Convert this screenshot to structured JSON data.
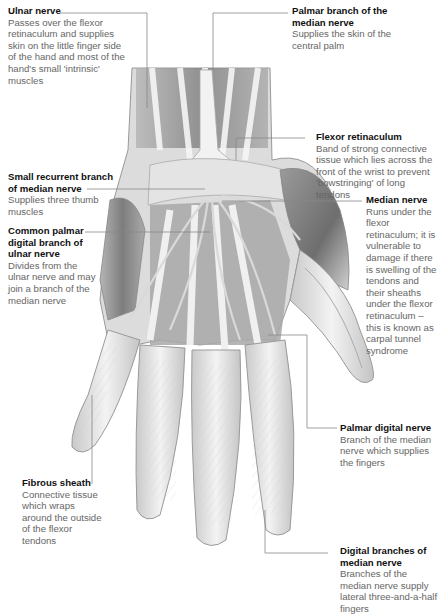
{
  "diagram": {
    "labels": [
      {
        "id": "ulnar-nerve",
        "title": "Ulnar nerve",
        "desc": "Passes over the flexor retinaculum and supplies skin on the little finger side of the hand and most of the hand's small 'intrinsic' muscles"
      },
      {
        "id": "palmar-branch-median",
        "title": "Palmar branch of the median nerve",
        "desc": "Supplies the skin of the central palm"
      },
      {
        "id": "flexor-retinaculum",
        "title": "Flexor retinaculum",
        "desc": "Band of strong connective tissue which lies across the front of the wrist to prevent 'bowstringing' of long tendons"
      },
      {
        "id": "small-recurrent-branch",
        "title": "Small recurrent branch of median nerve",
        "desc": "Supplies three thumb muscles"
      },
      {
        "id": "median-nerve",
        "title": "Median nerve",
        "desc": "Runs under the flexor retinaculum; it is vulnerable to damage if there is swelling of the tendons and their sheaths under the flexor retinaculum – this is known as carpal tunnel syndrome"
      },
      {
        "id": "common-palmar-digital-ulnar",
        "title": "Common palmar digital branch of ulnar nerve",
        "desc": "Divides from the ulnar nerve and may join a branch of the median nerve"
      },
      {
        "id": "palmar-digital-nerve",
        "title": "Palmar digital nerve",
        "desc": "Branch of the median nerve which supplies the fingers"
      },
      {
        "id": "fibrous-sheath",
        "title": "Fibrous sheath",
        "desc": "Connective tissue which wraps around the outside of the flexor tendons"
      },
      {
        "id": "digital-branches-median",
        "title": "Digital branches of median nerve",
        "desc": "Branches of the median nerve supply lateral three-and-a-half fingers"
      }
    ],
    "colors": {
      "title": "#111111",
      "desc": "#666666",
      "leader": "#888888",
      "muscle": "#8a8a8a",
      "tendon": "#efefef",
      "outline": "#9a9a9a"
    }
  }
}
